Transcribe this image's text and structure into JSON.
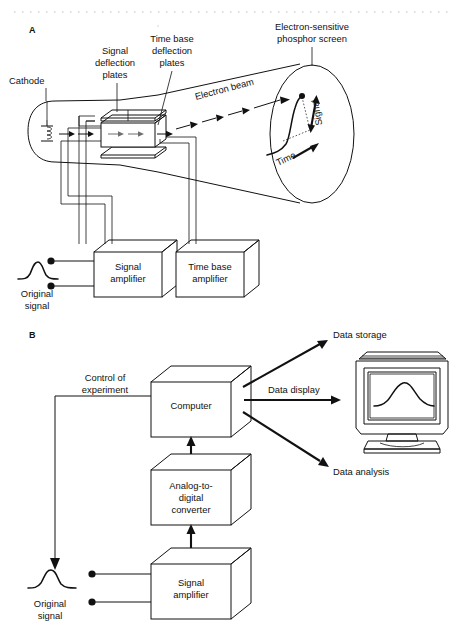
{
  "figure": {
    "background_color": "#ffffff",
    "ink_color": "#111111",
    "accent_gray": "#6f6f6f"
  },
  "panel_a": {
    "letter": "A",
    "labels": {
      "cathode": "Cathode",
      "signal_deflection_plates": "Signal\ndeflection\nplates",
      "signal_deflection_plates_l1": "Signal",
      "signal_deflection_plates_l2": "deflection",
      "signal_deflection_plates_l3": "plates",
      "time_base_deflection_plates_l1": "Time base",
      "time_base_deflection_plates_l2": "deflection",
      "time_base_deflection_plates_l3": "plates",
      "phosphor_screen_l1": "Electron-sensitive",
      "phosphor_screen_l2": "phosphor screen",
      "electron_beam": "Electron beam",
      "screen_axis_signal": "Signal",
      "screen_axis_time": "Time",
      "original_signal_l1": "Original",
      "original_signal_l2": "signal"
    },
    "boxes": [
      {
        "name": "signal-amplifier",
        "line1": "Signal",
        "line2": "amplifier"
      },
      {
        "name": "time-base-amplifier",
        "line1": "Time base",
        "line2": "amplifier"
      }
    ]
  },
  "panel_b": {
    "letter": "B",
    "labels": {
      "control_of_experiment_l1": "Control of",
      "control_of_experiment_l2": "experiment",
      "data_storage": "Data storage",
      "data_display": "Data display",
      "data_analysis": "Data analysis",
      "original_signal_l1": "Original",
      "original_signal_l2": "signal"
    },
    "boxes": [
      {
        "name": "computer",
        "line1": "Computer"
      },
      {
        "name": "analog-to-digital-converter",
        "line1": "Analog-to-",
        "line2": "digital",
        "line3": "converter"
      },
      {
        "name": "signal-amplifier",
        "line1": "Signal",
        "line2": "amplifier"
      }
    ],
    "monitor": {
      "name": "crt-monitor",
      "screen_trace": "signal waveform"
    }
  }
}
